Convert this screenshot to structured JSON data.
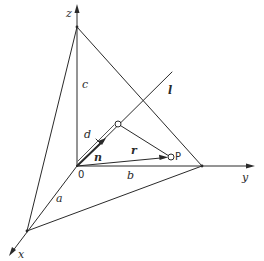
{
  "diagram": {
    "type": "3D coordinate geometry: plane intercept form with normal vector",
    "colors": {
      "line": "#2a2a2a",
      "background": "#ffffff"
    },
    "axes": {
      "x": {
        "label": "x"
      },
      "y": {
        "label": "y"
      },
      "z": {
        "label": "z"
      }
    },
    "origin": {
      "label": "0"
    },
    "intercepts": {
      "a": "a",
      "b": "b",
      "c": "c"
    },
    "vectors": {
      "n": "n",
      "r": "r"
    },
    "distance": "d",
    "line": "l",
    "point": "P"
  }
}
